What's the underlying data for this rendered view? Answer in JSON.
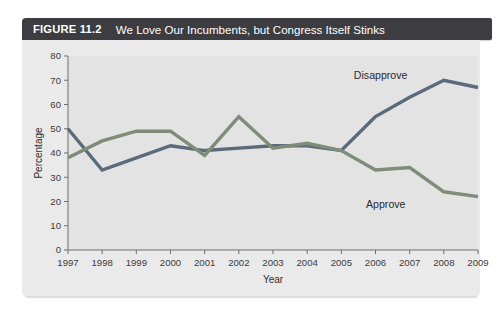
{
  "figure": {
    "label": "FIGURE 11.2",
    "title": "We Love Our Incumbents, but Congress Itself Stinks"
  },
  "colors": {
    "header_bg": "#3c3c41",
    "panel_bg": "#eaeaea",
    "plot_bg": "#e3e3e3",
    "disapprove": "#5b6b7b",
    "approve": "#7e8c78",
    "axis": "#6e6e6e",
    "text": "#2f2f2f"
  },
  "chart_data": {
    "type": "line",
    "title": "We Love Our Incumbents, but Congress Itself Stinks",
    "xlabel": "Year",
    "ylabel": "Percentage",
    "xlim": [
      1997,
      2009
    ],
    "ylim": [
      0,
      80
    ],
    "grid": false,
    "legend_position": "inline-annotation",
    "x": [
      1997,
      1998,
      1999,
      2000,
      2001,
      2002,
      2003,
      2004,
      2005,
      2006,
      2007,
      2008,
      2009
    ],
    "xtick_labels": [
      "1997",
      "1998",
      "1999",
      "2000",
      "2001",
      "2002",
      "2003",
      "2004",
      "2005",
      "2006",
      "2007",
      "2008",
      "2009"
    ],
    "ytick_labels": [
      "0",
      "10",
      "20",
      "30",
      "40",
      "50",
      "60",
      "70",
      "80"
    ],
    "ytick_values": [
      0,
      10,
      20,
      30,
      40,
      50,
      60,
      70,
      80
    ],
    "series": [
      {
        "name": "Disapprove",
        "color": "#5b6b7b",
        "values": [
          50,
          33,
          38,
          43,
          41,
          42,
          43,
          43,
          41,
          55,
          63,
          70,
          67
        ],
        "label": "Disapprove",
        "label_x": 2006.15,
        "label_y": 70.5
      },
      {
        "name": "Approve",
        "color": "#7e8c78",
        "values": [
          38,
          45,
          49,
          49,
          39,
          55,
          42,
          44,
          41,
          33,
          34,
          24,
          22
        ],
        "label": "Approve",
        "label_x": 2006.3,
        "label_y": 17.5
      }
    ],
    "annotations": [
      {
        "text": "Disapprove",
        "series": "Disapprove"
      },
      {
        "text": "Approve",
        "series": "Approve"
      }
    ]
  }
}
